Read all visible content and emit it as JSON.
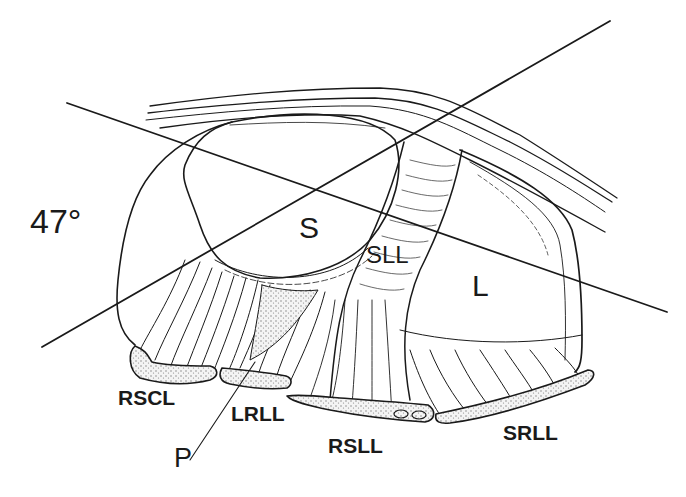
{
  "figure": {
    "angle_label": "47°",
    "regions": {
      "S": "S",
      "L": "L",
      "SLL": "SLL"
    },
    "ligaments": [
      {
        "id": "RSCL",
        "label": "RSCL"
      },
      {
        "id": "LRLL",
        "label": "LRLL"
      },
      {
        "id": "RSLL",
        "label": "RSLL"
      },
      {
        "id": "SRLL",
        "label": "SRLL"
      }
    ],
    "pointer_label": "P",
    "colors": {
      "ink": "#1a1a1a",
      "background": "#ffffff",
      "stipple": "#9a9a9a"
    }
  }
}
